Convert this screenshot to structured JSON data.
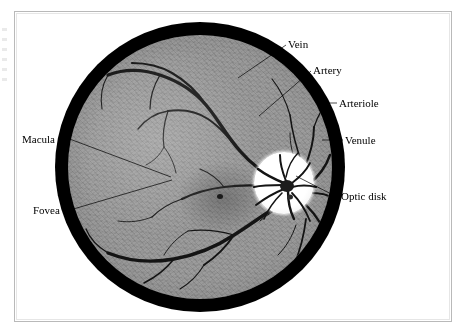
{
  "figure": {
    "kind": "retina-fundus-illustration",
    "background_color": "#ffffff",
    "frame_color": "#b9b9b9",
    "ring_color": "#000000",
    "retina_color": "#9c9c9c",
    "vessel_color": "#151515",
    "optic_disk_color": "#ffffff"
  },
  "labels": [
    {
      "id": "vein",
      "text": "Vein",
      "side": "right",
      "x": 288,
      "y": 38
    },
    {
      "id": "artery",
      "text": "Artery",
      "side": "right",
      "x": 313,
      "y": 64
    },
    {
      "id": "arteriole",
      "text": "Arteriole",
      "side": "right",
      "x": 339,
      "y": 97
    },
    {
      "id": "venule",
      "text": "Venule",
      "side": "right",
      "x": 345,
      "y": 134
    },
    {
      "id": "optic-disk",
      "text": "Optic disk",
      "side": "right",
      "x": 341,
      "y": 196
    },
    {
      "id": "macula",
      "text": "Macula",
      "side": "left",
      "x": 22,
      "y": 133
    },
    {
      "id": "fovea",
      "text": "Fovea",
      "side": "left",
      "x": 33,
      "y": 207
    }
  ],
  "leaders": [
    {
      "id": "vein-leader",
      "from": [
        286,
        45
      ],
      "to": [
        238,
        78
      ]
    },
    {
      "id": "artery-leader",
      "from": [
        311,
        71
      ],
      "to": [
        259,
        116
      ]
    },
    {
      "id": "arteriole-leader",
      "from": [
        337,
        103
      ],
      "to": [
        318,
        103
      ]
    },
    {
      "id": "venule-leader",
      "from": [
        343,
        140
      ],
      "to": [
        322,
        140
      ]
    },
    {
      "id": "optic-disk-leader",
      "from": [
        339,
        198
      ],
      "to": [
        296,
        176
      ]
    },
    {
      "id": "macula-leader",
      "from": [
        67,
        138
      ],
      "to": [
        171,
        177
      ]
    },
    {
      "id": "fovea-leader",
      "from": [
        70,
        210
      ],
      "to": [
        172,
        180
      ]
    }
  ]
}
